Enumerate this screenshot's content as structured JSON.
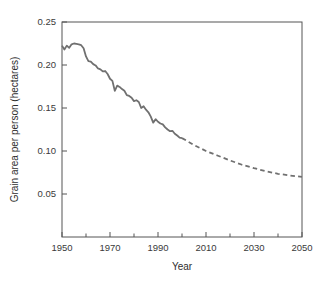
{
  "chart_data": {
    "type": "line",
    "title": "",
    "xlabel": "Year",
    "ylabel": "Grain area per person (hectares)",
    "xlim": [
      1950,
      2050
    ],
    "ylim": [
      0,
      0.25
    ],
    "grid": false,
    "legend": false,
    "x_ticks_major": [
      1950,
      1970,
      1990,
      2010,
      2030,
      2050
    ],
    "x_tick_labels": [
      "1950",
      "1970",
      "1990",
      "2010",
      "2030",
      "2050"
    ],
    "x_ticks_minor": [
      1960,
      1980,
      2000,
      2020,
      2040
    ],
    "y_ticks": [
      0.05,
      0.1,
      0.15,
      0.2,
      0.25
    ],
    "y_tick_labels": [
      "0.05",
      "0.10",
      "0.15",
      "0.20",
      "0.25"
    ],
    "line_color": "#707070",
    "line_width": 1.8,
    "series": [
      {
        "name": "historical",
        "style": "solid",
        "x": [
          1950,
          1951,
          1952,
          1953,
          1954,
          1955,
          1956,
          1957,
          1958,
          1959,
          1960,
          1961,
          1962,
          1963,
          1964,
          1965,
          1966,
          1967,
          1968,
          1969,
          1970,
          1971,
          1972,
          1973,
          1974,
          1975,
          1976,
          1977,
          1978,
          1979,
          1980,
          1981,
          1982,
          1983,
          1984,
          1985,
          1986,
          1987,
          1988,
          1989,
          1990,
          1991,
          1992,
          1993,
          1994,
          1995,
          1996,
          1997,
          1998,
          1999,
          2000
        ],
        "values": [
          0.2225,
          0.218,
          0.2225,
          0.22,
          0.224,
          0.225,
          0.2245,
          0.224,
          0.223,
          0.2195,
          0.21,
          0.2045,
          0.204,
          0.201,
          0.1995,
          0.196,
          0.195,
          0.1925,
          0.193,
          0.1895,
          0.184,
          0.1815,
          0.17,
          0.176,
          0.1745,
          0.172,
          0.17,
          0.165,
          0.164,
          0.162,
          0.158,
          0.159,
          0.157,
          0.15,
          0.152,
          0.148,
          0.145,
          0.14,
          0.133,
          0.137,
          0.134,
          0.132,
          0.131,
          0.1275,
          0.125,
          0.123,
          0.1235,
          0.12,
          0.118,
          0.1155,
          0.115
        ]
      },
      {
        "name": "projected",
        "style": "dashed",
        "x": [
          2000,
          2005,
          2010,
          2015,
          2020,
          2025,
          2030,
          2035,
          2040,
          2045,
          2050
        ],
        "values": [
          0.115,
          0.107,
          0.1,
          0.0945,
          0.089,
          0.084,
          0.08,
          0.0765,
          0.0735,
          0.0715,
          0.07
        ]
      }
    ]
  }
}
